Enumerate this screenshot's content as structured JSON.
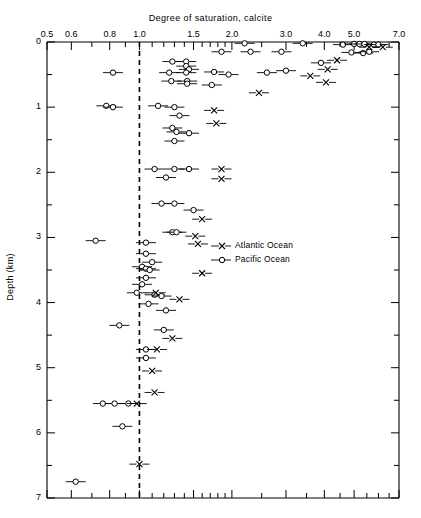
{
  "chart_data": {
    "type": "scatter",
    "title": "Degree of saturation, calcite",
    "xlabel": "Degree of saturation, calcite",
    "ylabel": "Depth (km)",
    "xscale": "log",
    "xlim": [
      0.5,
      7.0
    ],
    "ylim": [
      0,
      7
    ],
    "grid": false,
    "legend_position": "center-right",
    "reference_line": {
      "x": 1.0,
      "style": "dashed",
      "label": "saturation = 1.0"
    },
    "xticks": [
      0.5,
      0.6,
      0.8,
      1.0,
      1.5,
      2.0,
      3.0,
      4.0,
      5.0,
      7.0
    ],
    "xtick_labels": [
      "0.5",
      "0.6",
      "0.8",
      "1.0",
      "1.5",
      "2.0",
      "3.0",
      "4.0",
      "5.0",
      "7.0"
    ],
    "yticks": [
      0,
      1,
      2,
      3,
      4,
      5,
      6,
      7
    ],
    "ytick_labels": [
      "0",
      "1",
      "2",
      "3",
      "4",
      "5",
      "6",
      "7"
    ],
    "yminorticks": [
      0.5,
      1.5,
      2.5,
      3.5,
      4.5,
      5.5,
      6.5
    ],
    "series": [
      {
        "name": "Atlantic Ocean",
        "marker": "x",
        "legend_label": "Atlantic Ocean",
        "points": [
          {
            "x": 5.6,
            "y": 0.08
          },
          {
            "x": 6.2,
            "y": 0.08
          },
          {
            "x": 4.4,
            "y": 0.28
          },
          {
            "x": 4.1,
            "y": 0.42
          },
          {
            "x": 3.6,
            "y": 0.52
          },
          {
            "x": 2.45,
            "y": 0.78
          },
          {
            "x": 4.05,
            "y": 0.62
          },
          {
            "x": 1.75,
            "y": 1.05
          },
          {
            "x": 1.78,
            "y": 1.25
          },
          {
            "x": 1.85,
            "y": 1.95
          },
          {
            "x": 1.85,
            "y": 2.1
          },
          {
            "x": 1.6,
            "y": 2.72
          },
          {
            "x": 1.52,
            "y": 2.98
          },
          {
            "x": 1.55,
            "y": 3.1
          },
          {
            "x": 1.6,
            "y": 3.55
          },
          {
            "x": 1.13,
            "y": 3.85
          },
          {
            "x": 1.35,
            "y": 3.95
          },
          {
            "x": 1.28,
            "y": 4.55
          },
          {
            "x": 1.14,
            "y": 4.72
          },
          {
            "x": 1.1,
            "y": 5.05
          },
          {
            "x": 1.12,
            "y": 5.38
          },
          {
            "x": 0.98,
            "y": 5.55
          },
          {
            "x": 1.0,
            "y": 6.48
          }
        ]
      },
      {
        "name": "Pacific Ocean",
        "marker": "o",
        "legend_label": "Pacific Ocean",
        "points": [
          {
            "x": 2.2,
            "y": 0.02
          },
          {
            "x": 3.4,
            "y": 0.02
          },
          {
            "x": 4.6,
            "y": 0.04
          },
          {
            "x": 5.0,
            "y": 0.03
          },
          {
            "x": 5.2,
            "y": 0.03
          },
          {
            "x": 5.4,
            "y": 0.03
          },
          {
            "x": 5.8,
            "y": 0.04
          },
          {
            "x": 6.0,
            "y": 0.04
          },
          {
            "x": 1.85,
            "y": 0.15
          },
          {
            "x": 2.3,
            "y": 0.15
          },
          {
            "x": 2.9,
            "y": 0.15
          },
          {
            "x": 4.9,
            "y": 0.16
          },
          {
            "x": 5.35,
            "y": 0.17
          },
          {
            "x": 5.6,
            "y": 0.15
          },
          {
            "x": 1.28,
            "y": 0.3
          },
          {
            "x": 1.42,
            "y": 0.3
          },
          {
            "x": 1.42,
            "y": 0.37
          },
          {
            "x": 1.45,
            "y": 0.42
          },
          {
            "x": 3.9,
            "y": 0.32
          },
          {
            "x": 0.82,
            "y": 0.47
          },
          {
            "x": 1.25,
            "y": 0.47
          },
          {
            "x": 1.42,
            "y": 0.47
          },
          {
            "x": 1.75,
            "y": 0.46
          },
          {
            "x": 1.95,
            "y": 0.5
          },
          {
            "x": 2.6,
            "y": 0.47
          },
          {
            "x": 3.0,
            "y": 0.44
          },
          {
            "x": 1.27,
            "y": 0.6
          },
          {
            "x": 1.43,
            "y": 0.6
          },
          {
            "x": 1.43,
            "y": 0.64
          },
          {
            "x": 1.72,
            "y": 0.66
          },
          {
            "x": 0.78,
            "y": 0.98
          },
          {
            "x": 0.82,
            "y": 1.0
          },
          {
            "x": 1.15,
            "y": 0.98
          },
          {
            "x": 1.3,
            "y": 1.0
          },
          {
            "x": 1.35,
            "y": 1.13
          },
          {
            "x": 1.28,
            "y": 1.32
          },
          {
            "x": 1.32,
            "y": 1.38
          },
          {
            "x": 1.45,
            "y": 1.4
          },
          {
            "x": 1.3,
            "y": 1.52
          },
          {
            "x": 1.12,
            "y": 1.95
          },
          {
            "x": 1.3,
            "y": 1.95
          },
          {
            "x": 1.45,
            "y": 1.95
          },
          {
            "x": 1.22,
            "y": 2.08
          },
          {
            "x": 1.18,
            "y": 2.48
          },
          {
            "x": 1.3,
            "y": 2.48
          },
          {
            "x": 1.5,
            "y": 2.58
          },
          {
            "x": 1.28,
            "y": 2.92
          },
          {
            "x": 1.32,
            "y": 2.92
          },
          {
            "x": 0.72,
            "y": 3.05
          },
          {
            "x": 1.05,
            "y": 3.08
          },
          {
            "x": 1.05,
            "y": 3.25
          },
          {
            "x": 1.1,
            "y": 3.38
          },
          {
            "x": 1.02,
            "y": 3.45
          },
          {
            "x": 1.05,
            "y": 3.48
          },
          {
            "x": 1.08,
            "y": 3.5
          },
          {
            "x": 1.05,
            "y": 3.62
          },
          {
            "x": 1.02,
            "y": 3.72
          },
          {
            "x": 0.98,
            "y": 3.85
          },
          {
            "x": 1.12,
            "y": 3.88
          },
          {
            "x": 1.18,
            "y": 3.9
          },
          {
            "x": 1.07,
            "y": 4.02
          },
          {
            "x": 1.22,
            "y": 4.12
          },
          {
            "x": 0.86,
            "y": 4.35
          },
          {
            "x": 1.2,
            "y": 4.42
          },
          {
            "x": 1.05,
            "y": 4.72
          },
          {
            "x": 1.05,
            "y": 4.85
          },
          {
            "x": 0.76,
            "y": 5.55
          },
          {
            "x": 0.83,
            "y": 5.55
          },
          {
            "x": 0.92,
            "y": 5.55
          },
          {
            "x": 0.88,
            "y": 5.9
          },
          {
            "x": 0.62,
            "y": 6.75
          }
        ]
      }
    ]
  },
  "legend": {
    "entries": [
      {
        "label": "Atlantic Ocean",
        "marker": "x"
      },
      {
        "label": "Pacific Ocean",
        "marker": "o"
      }
    ]
  },
  "colors": {
    "line": "#000000",
    "background": "#ffffff"
  }
}
